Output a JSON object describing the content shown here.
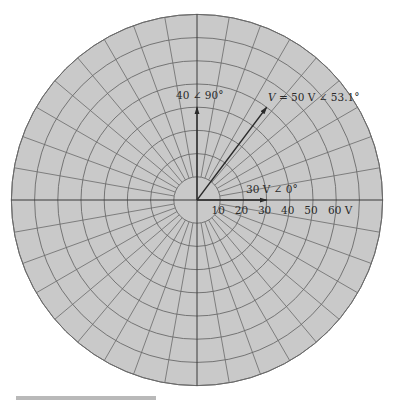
{
  "diagram": {
    "type": "polar-phasor-diagram",
    "units": "V",
    "ring_step": 10,
    "ring_count": 8,
    "spoke_step_deg": 10,
    "colors": {
      "disk_fill": "#c9c9c9",
      "grid_line": "#6a6a6a",
      "axis_line": "#3a3a3a",
      "arrow": "#2a2a2a",
      "label": "#2a2a2a"
    },
    "axis_ticks": [
      {
        "value": 10,
        "label": "10"
      },
      {
        "value": 20,
        "label": "20"
      },
      {
        "value": 30,
        "label": "30"
      },
      {
        "value": 40,
        "label": "40"
      },
      {
        "value": 50,
        "label": "50"
      },
      {
        "value": 60,
        "label": "60 V"
      }
    ],
    "phasors": [
      {
        "name": "phasor-30v-0deg",
        "magnitude": 30,
        "angle_deg": 0,
        "label": "30 V ∠ 0°"
      },
      {
        "name": "phasor-40-90deg",
        "magnitude": 40,
        "angle_deg": 90,
        "label": "40 ∠ 90°"
      },
      {
        "name": "phasor-v-50v-53deg",
        "magnitude": 50,
        "angle_deg": 53.1,
        "label_var": "V",
        "label_rest": " = 50 V ∠ 53.1°"
      }
    ]
  },
  "caption": {
    "visible_text": ""
  }
}
